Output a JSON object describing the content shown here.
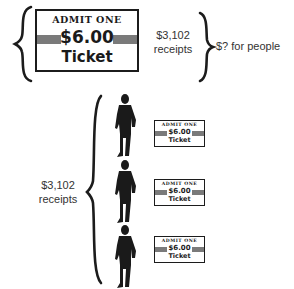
{
  "top_group": {
    "ticket": {
      "header": "ADMIT ONE",
      "price": "$6.00",
      "word": "Ticket"
    },
    "receipts_amount": "$3,102",
    "receipts_label": "receipts",
    "result_label": "$? for people"
  },
  "bottom_group": {
    "receipts_amount": "$3,102",
    "receipts_label": "receipts",
    "people": [
      {
        "icon": "person-silhouette-icon",
        "ticket": {
          "header": "ADMIT ONE",
          "price": "$6.00",
          "word": "Ticket"
        }
      },
      {
        "icon": "person-silhouette-icon",
        "ticket": {
          "header": "ADMIT ONE",
          "price": "$6.00",
          "word": "Ticket"
        }
      },
      {
        "icon": "person-silhouette-icon",
        "ticket": {
          "header": "ADMIT ONE",
          "price": "$6.00",
          "word": "Ticket"
        }
      }
    ]
  },
  "colors": {
    "ink": "#1c1c1c",
    "stripe_gray": "#7a7a7a",
    "background": "#ffffff"
  }
}
